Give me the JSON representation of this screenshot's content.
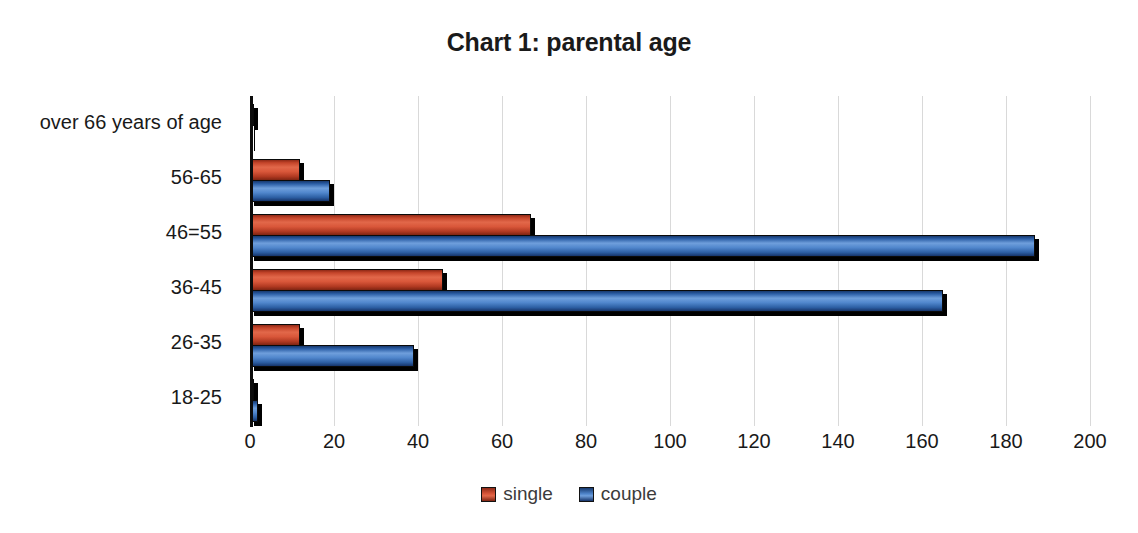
{
  "chart_data": {
    "type": "bar",
    "orientation": "horizontal",
    "title": "Chart 1: parental age",
    "xlabel": "",
    "ylabel": "",
    "xlim": [
      0,
      200
    ],
    "xticks": [
      0,
      20,
      40,
      60,
      80,
      100,
      120,
      140,
      160,
      180,
      200
    ],
    "categories": [
      "18-25",
      "26-35",
      "36-45",
      "46=55",
      "56-65",
      "over 66 years of age"
    ],
    "categories_top_to_bottom": [
      "over 66 years of age",
      "56-65",
      "46=55",
      "36-45",
      "26-35",
      "18-25"
    ],
    "series": [
      {
        "name": "single",
        "color": "#C0452A",
        "values": [
          1,
          12,
          46,
          67,
          12,
          1
        ]
      },
      {
        "name": "couple",
        "color": "#3B6FB6",
        "values": [
          2,
          39,
          165,
          187,
          19,
          0
        ]
      }
    ],
    "grid": true,
    "gridlines": "vertical",
    "legend_position": "bottom",
    "legend": [
      "single",
      "couple"
    ]
  },
  "chart": {
    "title": "Chart 1: parental age",
    "axis": {
      "x_tick_labels": [
        "0",
        "20",
        "40",
        "60",
        "80",
        "100",
        "120",
        "140",
        "160",
        "180",
        "200"
      ],
      "category_labels": [
        "over 66 years of age",
        "56-65",
        "46=55",
        "36-45",
        "26-35",
        "18-25"
      ]
    },
    "legend": {
      "items": [
        {
          "label": "single",
          "color": "#C0452A"
        },
        {
          "label": "couple",
          "color": "#3B6FB6"
        }
      ]
    },
    "colors": {
      "single": "#C0452A",
      "couple": "#3B6FB6",
      "gridline": "#D9D9D9",
      "axis": "#0C0C0C",
      "text": "#191919",
      "background": "#FFFFFF"
    }
  }
}
